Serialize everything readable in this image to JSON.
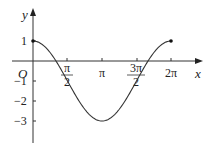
{
  "chart_data": {
    "type": "line",
    "title": "",
    "function": "y = 2cos(x) - 1",
    "xlabel": "x",
    "ylabel": "y",
    "origin_label": "O",
    "x_ticks": [
      {
        "value": 1.5708,
        "label_num": "π",
        "label_den": "2"
      },
      {
        "value": 3.1416,
        "label": "π"
      },
      {
        "value": 4.7124,
        "label_num": "3π",
        "label_den": "2"
      },
      {
        "value": 6.2832,
        "label": "2π"
      }
    ],
    "y_ticks": [
      {
        "value": 1,
        "label": "1"
      },
      {
        "value": -1,
        "label": "−1"
      },
      {
        "value": -2,
        "label": "−2"
      },
      {
        "value": -3,
        "label": "−3"
      }
    ],
    "xlim": [
      0,
      6.2832
    ],
    "ylim": [
      -3,
      1
    ],
    "x": [
      0,
      1.0472,
      1.5708,
      3.1416,
      4.7124,
      5.236,
      6.2832
    ],
    "values": [
      1,
      0,
      -1,
      -3,
      -1,
      0,
      1
    ],
    "endpoints": [
      {
        "x": 0,
        "y": 1
      },
      {
        "x": 6.2832,
        "y": 1
      }
    ],
    "grid": false,
    "legend": null,
    "line_color": "#333333"
  }
}
